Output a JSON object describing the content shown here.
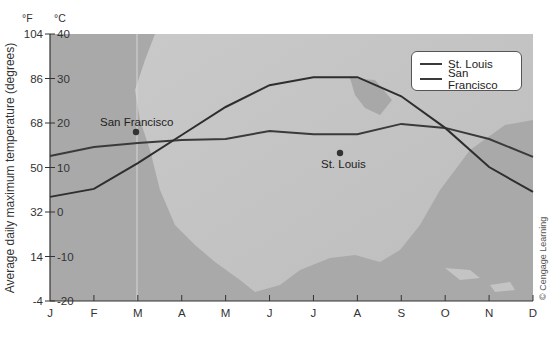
{
  "chart_data": {
    "type": "line",
    "title": "",
    "xlabel": "",
    "ylabel": "Average daily maximum temperature (degrees)",
    "units": {
      "left": "°F",
      "right": "°C"
    },
    "categories": [
      "J",
      "F",
      "M",
      "A",
      "M",
      "J",
      "J",
      "A",
      "S",
      "O",
      "N",
      "D"
    ],
    "y_ticks_celsius": [
      40,
      30,
      20,
      10,
      0,
      -10,
      -20
    ],
    "y_ticks_fahrenheit": [
      104,
      86,
      68,
      50,
      32,
      14,
      -4
    ],
    "ylim": [
      -20,
      40
    ],
    "series": [
      {
        "name": "St. Louis",
        "unit": "°C",
        "values": [
          3.4,
          5.2,
          11.0,
          17.3,
          23.6,
          28.5,
          30.3,
          30.3,
          26.0,
          18.9,
          10.1,
          4.5
        ]
      },
      {
        "name": "San Francisco",
        "unit": "°C",
        "values": [
          12.6,
          14.6,
          15.5,
          16.2,
          16.4,
          18.2,
          17.5,
          17.5,
          19.8,
          18.9,
          16.4,
          12.4
        ]
      }
    ],
    "legend": {
      "position": "top-right",
      "entries": [
        "St. Louis",
        "San Francisco"
      ]
    },
    "annotations": [
      {
        "text": "San Francisco",
        "type": "map-location"
      },
      {
        "text": "St. Louis",
        "type": "map-location"
      }
    ],
    "background": "shaded relief map of the United States",
    "grid": false
  },
  "credit": "© Cengage Learning"
}
